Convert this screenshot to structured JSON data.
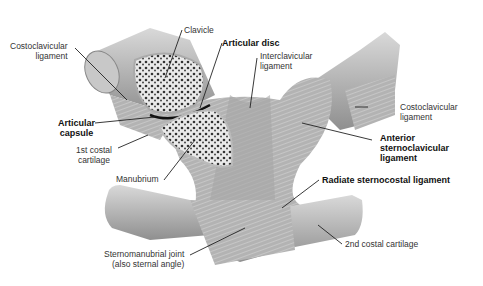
{
  "diagram": {
    "labels": {
      "clavicle": "Clavicle",
      "articular_disc": "Articular disc",
      "costoclavicular_left_1": "Costoclavicular",
      "costoclavicular_left_2": "ligament",
      "interclavicular_1": "Interclavicular",
      "interclavicular_2": "ligament",
      "costoclavicular_right_1": "Costoclavicular",
      "costoclavicular_right_2": "ligament",
      "articular_capsule_1": "Articular",
      "articular_capsule_2": "capsule",
      "first_costal_1": "1st costal",
      "first_costal_2": "cartilage",
      "anterior_sc_1": "Anterior",
      "anterior_sc_2": "sternoclavicular",
      "anterior_sc_3": "ligament",
      "manubrium": "Manubrium",
      "radiate": "Radiate sternocostal ligament",
      "sternomanubrial_1": "Sternomanubrial joint",
      "sternomanubrial_2": "(also sternal angle)",
      "second_costal": "2nd costal cartilage"
    },
    "colors": {
      "bone": "#bdbdbd",
      "ligament": "#a9a9a9",
      "spongy": "#e8e8e8",
      "line": "#222222"
    }
  }
}
